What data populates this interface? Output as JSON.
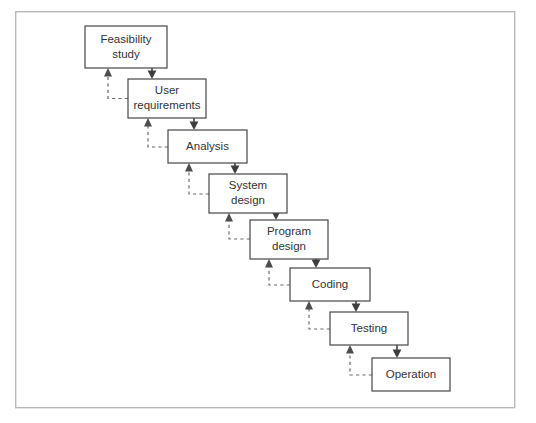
{
  "diagram": {
    "type": "flowchart",
    "frame": {
      "x": 15,
      "y": 11,
      "width": 500,
      "height": 398,
      "border_color": "#b8b8b8"
    },
    "colors": {
      "background": "#ffffff",
      "box_border": "#4d4d4d",
      "box_fill": "#ffffff",
      "text": "#333333",
      "flow_arrow": "#4d4d4d",
      "feedback_arrow": "#6b6b6b"
    },
    "stages": [
      {
        "id": "feasibility-study",
        "label_line1": "Feasibility",
        "label_line2": "study",
        "x": 85,
        "y": 26,
        "width": 82,
        "height": 42
      },
      {
        "id": "user-requirements",
        "label_line1": "User",
        "label_line2": "requirements",
        "x": 128,
        "y": 79,
        "width": 78,
        "height": 39
      },
      {
        "id": "analysis",
        "label_line1": "Analysis",
        "label_line2": "",
        "x": 168,
        "y": 130,
        "width": 79,
        "height": 33
      },
      {
        "id": "system-design",
        "label_line1": "System",
        "label_line2": "design",
        "x": 209,
        "y": 174,
        "width": 78,
        "height": 39
      },
      {
        "id": "program-design",
        "label_line1": "Program",
        "label_line2": "design",
        "x": 250,
        "y": 220,
        "width": 78,
        "height": 39
      },
      {
        "id": "coding",
        "label_line1": "Coding",
        "label_line2": "",
        "x": 290,
        "y": 268,
        "width": 80,
        "height": 33
      },
      {
        "id": "testing",
        "label_line1": "Testing",
        "label_line2": "",
        "x": 330,
        "y": 312,
        "width": 78,
        "height": 33
      },
      {
        "id": "operation",
        "label_line1": "Operation",
        "label_line2": "",
        "x": 372,
        "y": 358,
        "width": 78,
        "height": 33
      }
    ],
    "flow_connections": [
      {
        "from": "feasibility-study",
        "to": "user-requirements"
      },
      {
        "from": "user-requirements",
        "to": "analysis"
      },
      {
        "from": "analysis",
        "to": "system-design"
      },
      {
        "from": "system-design",
        "to": "program-design"
      },
      {
        "from": "program-design",
        "to": "coding"
      },
      {
        "from": "coding",
        "to": "testing"
      },
      {
        "from": "testing",
        "to": "operation"
      }
    ],
    "feedback_connections": [
      {
        "from": "user-requirements",
        "to": "feasibility-study"
      },
      {
        "from": "analysis",
        "to": "user-requirements"
      },
      {
        "from": "system-design",
        "to": "analysis"
      },
      {
        "from": "program-design",
        "to": "system-design"
      },
      {
        "from": "coding",
        "to": "program-design"
      },
      {
        "from": "testing",
        "to": "coding"
      },
      {
        "from": "operation",
        "to": "testing"
      }
    ]
  }
}
